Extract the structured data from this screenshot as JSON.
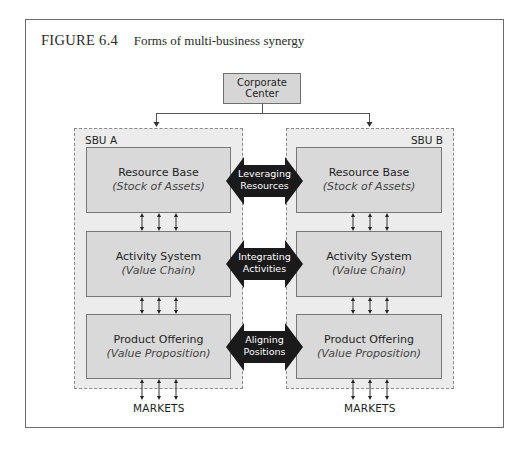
{
  "figure": {
    "number": "FIGURE 6.4",
    "caption": "Forms of multi-business synergy"
  },
  "corporate_center": {
    "line1": "Corporate",
    "line2": "Center"
  },
  "sbus": [
    {
      "label": "SBU A",
      "boxes": [
        {
          "title": "Resource Base",
          "subtitle": "(Stock of Assets)"
        },
        {
          "title": "Activity System",
          "subtitle": "(Value Chain)"
        },
        {
          "title": "Product Offering",
          "subtitle": "(Value Proposition)"
        }
      ],
      "markets": "MARKETS"
    },
    {
      "label": "SBU B",
      "boxes": [
        {
          "title": "Resource Base",
          "subtitle": "(Stock of Assets)"
        },
        {
          "title": "Activity System",
          "subtitle": "(Value Chain)"
        },
        {
          "title": "Product Offering",
          "subtitle": "(Value Proposition)"
        }
      ],
      "markets": "MARKETS"
    }
  ],
  "synergies": [
    {
      "line1": "Leveraging",
      "line2": "Resources"
    },
    {
      "line1": "Integrating",
      "line2": "Activities"
    },
    {
      "line1": "Aligning",
      "line2": "Positions"
    }
  ],
  "colors": {
    "box_fill": "#d9d9d9",
    "container_fill": "#ececec",
    "arrow_fill": "#1a1a1a"
  }
}
